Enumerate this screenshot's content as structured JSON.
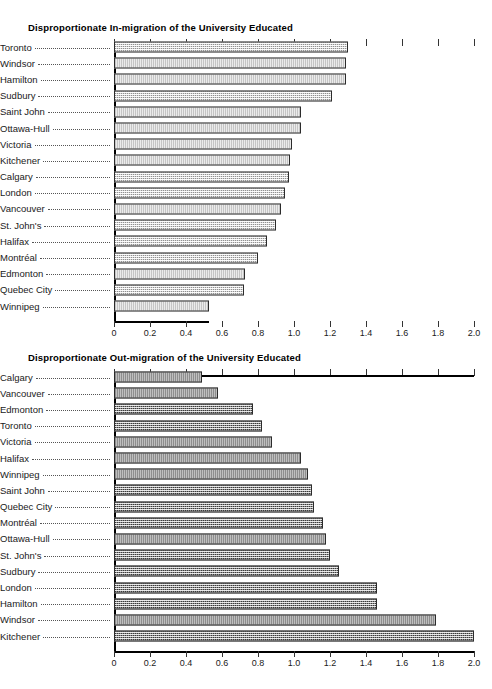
{
  "chart_data": [
    {
      "type": "bar",
      "orientation": "horizontal",
      "title": "Disproportionate In-migration of the University Educated",
      "xlabel": "",
      "ylabel": "",
      "xlim": [
        0,
        2.0
      ],
      "xticks": [
        "0",
        "0.2",
        "0.4",
        "0.6",
        "0.8",
        "1.0",
        "1.2",
        "1.4",
        "1.6",
        "1.8",
        "2.0"
      ],
      "xtick_values": [
        0,
        0.2,
        0.4,
        0.6,
        0.8,
        1.0,
        1.2,
        1.4,
        1.6,
        1.8,
        2.0
      ],
      "grid": false,
      "legend": "none",
      "bar_style": "light-stipple",
      "categories": [
        "Toronto",
        "Windsor",
        "Hamilton",
        "Sudbury",
        "Saint John",
        "Ottawa-Hull",
        "Victoria",
        "Kitchener",
        "Calgary",
        "London",
        "Vancouver",
        "St. John's",
        "Halifax",
        "Montréal",
        "Edmonton",
        "Quebec City",
        "Winnipeg"
      ],
      "values": [
        1.3,
        1.29,
        1.29,
        1.21,
        1.04,
        1.04,
        0.99,
        0.98,
        0.97,
        0.95,
        0.93,
        0.9,
        0.85,
        0.8,
        0.73,
        0.72,
        0.53
      ]
    },
    {
      "type": "bar",
      "orientation": "horizontal",
      "title": "Disproportionate Out-migration of the University Educated",
      "xlabel": "",
      "ylabel": "",
      "xlim": [
        0,
        2.0
      ],
      "xticks": [
        "0",
        "0.2",
        "0.4",
        "0.6",
        "0.8",
        "1.0",
        "1.2",
        "1.4",
        "1.6",
        "1.8",
        "2.0"
      ],
      "xtick_values": [
        0,
        0.2,
        0.4,
        0.6,
        0.8,
        1.0,
        1.2,
        1.4,
        1.6,
        1.8,
        2.0
      ],
      "grid": false,
      "legend": "none",
      "bar_style": "dark-stipple",
      "categories": [
        "Calgary",
        "Vancouver",
        "Edmonton",
        "Toronto",
        "Victoria",
        "Halifax",
        "Winnipeg",
        "Saint John",
        "Quebec City",
        "Montréal",
        "Ottawa-Hull",
        "St. John's",
        "Sudbury",
        "London",
        "Hamilton",
        "Windsor",
        "Kitchener"
      ],
      "values": [
        0.49,
        0.58,
        0.77,
        0.82,
        0.88,
        1.04,
        1.08,
        1.1,
        1.11,
        1.16,
        1.18,
        1.2,
        1.25,
        1.46,
        1.46,
        1.79,
        2.0
      ]
    }
  ],
  "colors": {
    "axis": "#000000",
    "bar_border": "#2b2b2b",
    "bar_fill_light": "#d9d9d9",
    "bar_fill_dark": "#8f8f8f",
    "text": "#1a1a1a",
    "background": "#ffffff"
  }
}
